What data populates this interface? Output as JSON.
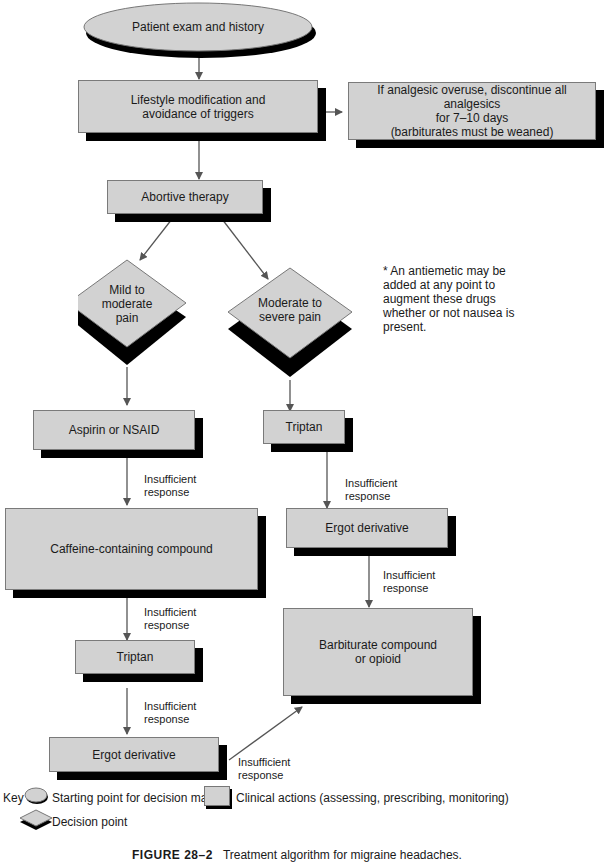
{
  "title": "Treatment algorithm for migraine headaches",
  "nodes": {
    "start": "Patient exam and history",
    "lifestyle_line1": "Lifestyle modification and",
    "lifestyle_line2": "avoidance of triggers",
    "overuse_line1": "If analgesic overuse, discontinue all analgesics",
    "overuse_line2": "for 7–10 days",
    "overuse_line3": "(barbiturates must be weaned)",
    "abortive": "Abortive therapy",
    "mild_line1": "Mild to",
    "mild_line2": "moderate",
    "mild_line3": "pain",
    "severe_line1": "Moderate to",
    "severe_line2": "severe pain",
    "aspirin": "Aspirin or NSAID",
    "triptan_right": "Triptan",
    "caffeine": "Caffeine-containing compound",
    "ergot_right": "Ergot derivative",
    "triptan_left": "Triptan",
    "barbiturate_line1": "Barbiturate compound",
    "barbiturate_line2": "or opioid",
    "ergot_left": "Ergot derivative"
  },
  "edge_labels": {
    "line1": "Insufficient",
    "line2": "response"
  },
  "note": {
    "line1": "* An antiemetic may be",
    "line2": "added at any point to",
    "line3": "augment these drugs",
    "line4": "whether or not nausea is",
    "line5": "present."
  },
  "key": {
    "label": "Key",
    "start": "Starting point for decision making",
    "action": "Clinical actions (assessing, prescribing, monitoring)",
    "decision": "Decision point"
  },
  "caption": {
    "figure": "FIGURE 28–2",
    "text": "Treatment algorithm for migraine headaches."
  },
  "colors": {
    "fill": "#d2d2d2",
    "shadow": "#000000",
    "line": "#555555"
  }
}
